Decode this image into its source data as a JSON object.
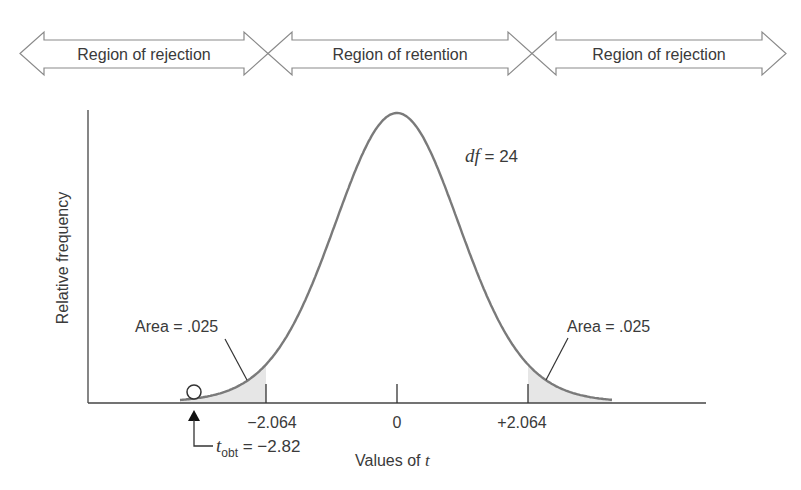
{
  "regions": [
    {
      "label": "Region of rejection",
      "x1": 20,
      "x2": 268
    },
    {
      "label": "Region of retention",
      "x1": 268,
      "x2": 532
    },
    {
      "label": "Region of rejection",
      "x1": 532,
      "x2": 786
    }
  ],
  "axes": {
    "ylabel": "Relative frequency",
    "xlabel_prefix": "Values of ",
    "xlabel_var": "t"
  },
  "ticks": [
    {
      "value": -2.064,
      "label": "−2.064"
    },
    {
      "value": 0,
      "label": "0"
    },
    {
      "value": 2.064,
      "label": "+2.064"
    }
  ],
  "annotations": {
    "df_var": "df",
    "df_value": " = 24",
    "left_area": "Area = .025",
    "right_area": "Area = .025",
    "tobt_var": "t",
    "tobt_sub": "obt",
    "tobt_value": " = −2.82"
  },
  "colors": {
    "curve": "#7a7a7a",
    "shade": "#e6e6e6",
    "axis": "#444444",
    "arrow_outline": "#8a8a8a"
  },
  "chart_data": {
    "type": "line",
    "title": "",
    "xlabel": "Values of t",
    "ylabel": "Relative frequency",
    "df": 24,
    "critical_values": [
      -2.064,
      2.064
    ],
    "tail_areas": [
      0.025,
      0.025
    ],
    "t_obtained": -2.82,
    "x_ticks": [
      -2.064,
      0,
      2.064
    ],
    "x_tick_labels": [
      "−2.064",
      "0",
      "+2.064"
    ],
    "regions": [
      "Region of rejection",
      "Region of retention",
      "Region of rejection"
    ],
    "xlim": [
      -3.4,
      3.4
    ],
    "grid": false
  }
}
